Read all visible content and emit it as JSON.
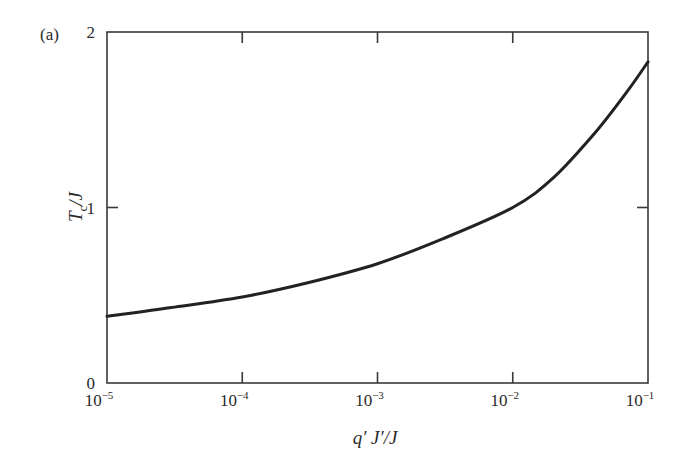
{
  "panel_label": "(a)",
  "chart_data": {
    "type": "line",
    "title": "",
    "xlabel": "q′ J′/J",
    "ylabel": "T_c/J",
    "xscale": "log",
    "xlim": [
      1e-05,
      0.1
    ],
    "ylim": [
      0,
      2
    ],
    "grid": false,
    "legend": null,
    "x_ticks": [
      {
        "value": 1e-05,
        "base": "10",
        "exp": "−5"
      },
      {
        "value": 0.0001,
        "base": "10",
        "exp": "−4"
      },
      {
        "value": 0.001,
        "base": "10",
        "exp": "−3"
      },
      {
        "value": 0.01,
        "base": "10",
        "exp": "−2"
      },
      {
        "value": 0.1,
        "base": "10",
        "exp": "−1"
      }
    ],
    "y_ticks": [
      {
        "value": 0,
        "label": "0"
      },
      {
        "value": 1,
        "label": "1"
      },
      {
        "value": 2,
        "label": "2"
      }
    ],
    "series": [
      {
        "name": "Tc/J",
        "x": [
          1e-05,
          3e-05,
          0.0001,
          0.0003,
          0.001,
          0.003,
          0.01,
          0.02,
          0.04,
          0.07,
          0.1
        ],
        "y": [
          0.38,
          0.43,
          0.49,
          0.57,
          0.68,
          0.82,
          1.0,
          1.17,
          1.42,
          1.66,
          1.83
        ]
      }
    ]
  }
}
